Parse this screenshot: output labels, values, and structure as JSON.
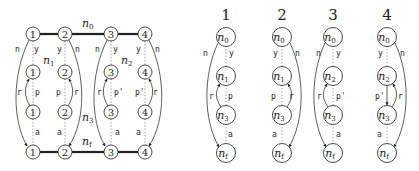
{
  "left_diagram": {
    "top_row": [
      "1",
      "2",
      "3",
      "4"
    ],
    "mid_row_1": [
      "1",
      "2",
      "3",
      "4"
    ],
    "mid_row_2": [
      "1",
      "2",
      "3",
      "4"
    ],
    "bottom_row": [
      "1",
      "2",
      "3",
      "4"
    ],
    "group_labels": {
      "n0": "n",
      "n0_sub": "0",
      "n1": "n",
      "n1_sub": "1",
      "n2": "n",
      "n2_sub": "2",
      "n3": "n",
      "n3_sub": "3",
      "nf": "n",
      "nf_sub": "f"
    },
    "edge_labels": {
      "n": "n",
      "y": "y",
      "r": "r",
      "p": "p",
      "p_prime": "p'",
      "a": "a"
    }
  },
  "right_trees": [
    {
      "header": "1",
      "nodes": [
        "n0",
        "n1",
        "n3",
        "nf"
      ],
      "labels": {
        "n": "n",
        "y": "y",
        "r": "r",
        "p": "p",
        "a": "a"
      }
    },
    {
      "header": "2",
      "nodes": [
        "n0",
        "n1",
        "n3",
        "nf"
      ],
      "labels": {
        "n": "n",
        "y": "y",
        "r": "r",
        "p": "p",
        "a": "a"
      }
    },
    {
      "header": "3",
      "nodes": [
        "n0",
        "n2",
        "n3",
        "nf"
      ],
      "labels": {
        "n": "n",
        "y": "y",
        "r": "r",
        "p": "p'",
        "a": "a"
      }
    },
    {
      "header": "4",
      "nodes": [
        "n0",
        "n2",
        "n3",
        "nf"
      ],
      "labels": {
        "n": "n",
        "y": "y",
        "r": "r",
        "p": "p'",
        "a": "a"
      }
    }
  ],
  "node_text": {
    "n": "n",
    "sub0": "0",
    "sub1": "1",
    "sub2": "2",
    "sub3": "3",
    "subf": "f"
  }
}
